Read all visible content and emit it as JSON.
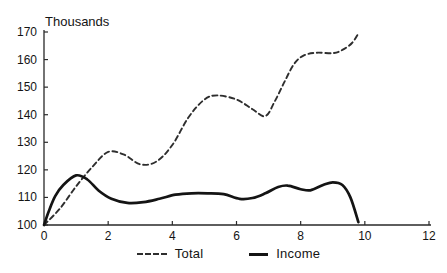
{
  "page": {
    "background": "#ffffff"
  },
  "chart_data": {
    "type": "line",
    "title": "",
    "ylabel": "Thousands",
    "xlabel": "",
    "xlim": [
      0,
      12
    ],
    "ylim": [
      100,
      170
    ],
    "x_ticks": [
      0,
      2,
      4,
      6,
      8,
      10,
      12
    ],
    "y_ticks": [
      100,
      110,
      120,
      130,
      140,
      150,
      160,
      170
    ],
    "grid": false,
    "legend_position": "bottom-center",
    "axis_color": "#2a2a2a",
    "text_color": "#141414",
    "series": [
      {
        "name": "Total",
        "style": "dashed",
        "color": "#2e2e2e",
        "stroke_width": 1.9,
        "points": [
          [
            0,
            100
          ],
          [
            0.5,
            106
          ],
          [
            1,
            114
          ],
          [
            1.5,
            121
          ],
          [
            2,
            126.5
          ],
          [
            2.5,
            125.5
          ],
          [
            3,
            122
          ],
          [
            3.5,
            123
          ],
          [
            4,
            129
          ],
          [
            4.5,
            139
          ],
          [
            5,
            145.5
          ],
          [
            5.4,
            147
          ],
          [
            6,
            145.5
          ],
          [
            6.5,
            142
          ],
          [
            6.9,
            139.5
          ],
          [
            7.2,
            145
          ],
          [
            7.5,
            152
          ],
          [
            7.8,
            158.5
          ],
          [
            8.1,
            161.5
          ],
          [
            8.5,
            162.5
          ],
          [
            9.0,
            162.3
          ],
          [
            9.3,
            163.5
          ],
          [
            9.6,
            166
          ],
          [
            9.8,
            169.5
          ]
        ]
      },
      {
        "name": "Income",
        "style": "solid",
        "color": "#141414",
        "stroke_width": 2.7,
        "points": [
          [
            0,
            100
          ],
          [
            0.15,
            105
          ],
          [
            0.35,
            110.5
          ],
          [
            0.6,
            114.5
          ],
          [
            1,
            118
          ],
          [
            1.35,
            116.5
          ],
          [
            1.7,
            112.5
          ],
          [
            2.1,
            109.5
          ],
          [
            2.6,
            108
          ],
          [
            3.1,
            108.3
          ],
          [
            3.6,
            109.5
          ],
          [
            4.1,
            111
          ],
          [
            4.6,
            111.5
          ],
          [
            5.1,
            111.5
          ],
          [
            5.6,
            111.2
          ],
          [
            6.1,
            109.5
          ],
          [
            6.5,
            109.8
          ],
          [
            6.9,
            111.5
          ],
          [
            7.3,
            113.8
          ],
          [
            7.6,
            114.3
          ],
          [
            8.0,
            113
          ],
          [
            8.3,
            112.6
          ],
          [
            8.7,
            114.5
          ],
          [
            9.0,
            115.5
          ],
          [
            9.3,
            114.5
          ],
          [
            9.55,
            110
          ],
          [
            9.8,
            101
          ]
        ]
      }
    ]
  }
}
